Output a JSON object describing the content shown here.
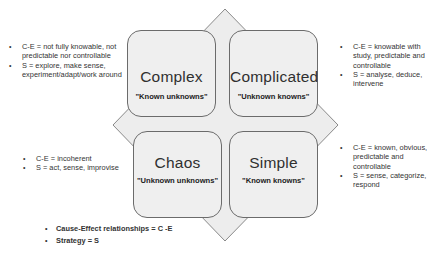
{
  "diagram": {
    "type": "cynefin-framework",
    "colors": {
      "box_fill": "#efefef",
      "box_border": "#6b6b6b",
      "diamond_fill": "#ededed",
      "diamond_border": "#8a8a8a"
    },
    "quadrants": [
      {
        "id": "complex",
        "title": "Complex",
        "subtitle": "\"Known unknowns\"",
        "notes": [
          "C-E = not fully knowable, not predictable nor controllable",
          "S = explore, make sense, experiment/adapt/work around"
        ]
      },
      {
        "id": "complicated",
        "title": "Complicated",
        "subtitle": "\"Unknown knowns\"",
        "notes": [
          "C-E = knowable with study, predictable and controllable",
          "S = analyse, deduce, intervene"
        ]
      },
      {
        "id": "chaos",
        "title": "Chaos",
        "subtitle": "\"Unknown unknowns\"",
        "notes": [
          "C-E = incoherent",
          "S = act, sense, improvise"
        ]
      },
      {
        "id": "simple",
        "title": "Simple",
        "subtitle": "\"Known knowns\"",
        "notes": [
          "C-E = known, obvious, predictable and controllable",
          "S = sense, categorize, respond"
        ]
      }
    ],
    "legend": [
      "Cause-Effect relationships = C -E",
      "Strategy = S"
    ],
    "bullet_glyph": "•"
  }
}
